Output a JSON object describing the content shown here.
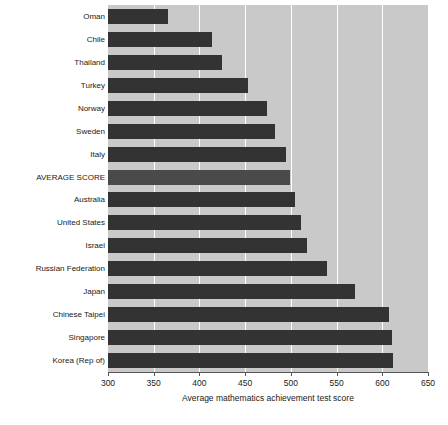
{
  "chart_data": {
    "type": "bar",
    "orientation": "horizontal",
    "title": "",
    "xlabel": "Average mathematics achievement test score",
    "ylabel": "",
    "xlim": [
      300,
      650
    ],
    "xticks": [
      300,
      350,
      400,
      450,
      500,
      550,
      600,
      650
    ],
    "grid": "vertical-white-gridlines",
    "legend": "none",
    "categories": [
      "Oman",
      "Chile",
      "Thailand",
      "Turkey",
      "Norway",
      "Sweden",
      "Italy",
      "AVERAGE SCORE",
      "Australia",
      "United States",
      "Israel",
      "Russian Federation",
      "Japan",
      "Chinese Taipei",
      "Singapore",
      "Korea (Rep of)"
    ],
    "values": [
      366,
      414,
      425,
      453,
      474,
      483,
      495,
      499,
      505,
      511,
      518,
      540,
      570,
      607,
      611,
      612
    ],
    "highlight_category": "AVERAGE SCORE",
    "colors": {
      "bar": "#333333",
      "bar_highlight": "#4a4a4a",
      "plot_background": "#c9c9c9",
      "gridline": "#ffffff",
      "axis": "#555555",
      "text": "#1a1a1a"
    }
  }
}
